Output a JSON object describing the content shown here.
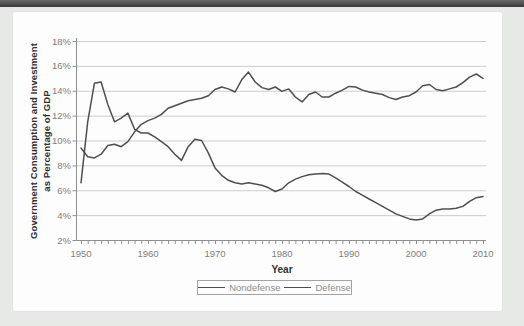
{
  "page": {
    "background_color": "#e7e9e7",
    "top_bar_color": "#4a4a4a",
    "panel_color": "#fdfdfd"
  },
  "chart_data": {
    "type": "line",
    "title": "",
    "xlabel": "Year",
    "ylabel": "Government Consumption and Investment as Percentage of GDP",
    "ylabel_line1": "Government Consumption and Investment",
    "ylabel_line2": "as Percentage of GDP",
    "xlim": [
      1950,
      2010
    ],
    "ylim": [
      2,
      18
    ],
    "grid": true,
    "legend_position": "bottom",
    "x_ticks": [
      1950,
      1960,
      1970,
      1980,
      1990,
      2000,
      2010
    ],
    "x_minor_tick_step": 1,
    "y_ticks": [
      {
        "label": "18%",
        "value": 18
      },
      {
        "label": "16%",
        "value": 16
      },
      {
        "label": "14%",
        "value": 14
      },
      {
        "label": "12%",
        "value": 12
      },
      {
        "label": "10%",
        "value": 10
      },
      {
        "label": "8%",
        "value": 8
      },
      {
        "label": "6%",
        "value": 6
      },
      {
        "label": "4%",
        "value": 4
      },
      {
        "label": "2%",
        "value": 2
      }
    ],
    "colors": {
      "line": "#4f4f4f",
      "grid": "#cdcdcd",
      "axis": "#909090",
      "tick_label": "#7d7d7d"
    },
    "years": [
      1950,
      1951,
      1952,
      1953,
      1954,
      1955,
      1956,
      1957,
      1958,
      1959,
      1960,
      1961,
      1962,
      1963,
      1964,
      1965,
      1966,
      1967,
      1968,
      1969,
      1970,
      1971,
      1972,
      1973,
      1974,
      1975,
      1976,
      1977,
      1978,
      1979,
      1980,
      1981,
      1982,
      1983,
      1984,
      1985,
      1986,
      1987,
      1988,
      1989,
      1990,
      1991,
      1992,
      1993,
      1994,
      1995,
      1996,
      1997,
      1998,
      1999,
      2000,
      2001,
      2002,
      2003,
      2004,
      2005,
      2006,
      2007,
      2008,
      2009,
      2010
    ],
    "series": [
      {
        "name": "Nondefense",
        "values": [
          9.4,
          8.7,
          8.6,
          8.9,
          9.6,
          9.7,
          9.5,
          9.9,
          10.7,
          11.3,
          11.6,
          11.8,
          12.1,
          12.6,
          12.8,
          13.0,
          13.2,
          13.3,
          13.4,
          13.6,
          14.1,
          14.3,
          14.15,
          13.9,
          14.9,
          15.5,
          14.7,
          14.25,
          14.1,
          14.3,
          13.95,
          14.15,
          13.5,
          13.1,
          13.7,
          13.9,
          13.5,
          13.5,
          13.8,
          14.05,
          14.35,
          14.3,
          14.05,
          13.9,
          13.8,
          13.7,
          13.45,
          13.3,
          13.5,
          13.6,
          13.9,
          14.4,
          14.5,
          14.1,
          14.0,
          14.15,
          14.3,
          14.65,
          15.1,
          15.35,
          15.0
        ]
      },
      {
        "name": "Defense",
        "values": [
          6.6,
          11.5,
          14.6,
          14.7,
          12.9,
          11.5,
          11.8,
          12.2,
          10.9,
          10.6,
          10.6,
          10.3,
          9.9,
          9.5,
          8.9,
          8.4,
          9.5,
          10.1,
          10.0,
          9.0,
          7.8,
          7.2,
          6.8,
          6.6,
          6.5,
          6.6,
          6.5,
          6.4,
          6.2,
          5.9,
          6.1,
          6.6,
          6.9,
          7.1,
          7.25,
          7.3,
          7.35,
          7.3,
          7.0,
          6.65,
          6.3,
          5.9,
          5.6,
          5.3,
          5.0,
          4.7,
          4.4,
          4.1,
          3.9,
          3.7,
          3.6,
          3.7,
          4.1,
          4.4,
          4.5,
          4.5,
          4.55,
          4.7,
          5.1,
          5.4,
          5.5
        ]
      }
    ]
  }
}
